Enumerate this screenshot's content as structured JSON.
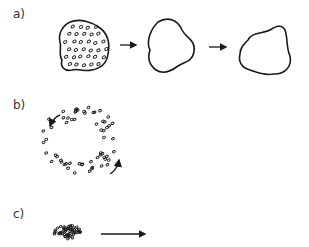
{
  "panels": [
    {
      "id": "a",
      "label": "a)",
      "description": "Cell-filled tissue aggregate loses cells, leaving empty shapes that change form"
    },
    {
      "id": "b",
      "label": "b)",
      "description": "Ring of dots with rotational arrows (circulating motion)"
    },
    {
      "id": "c",
      "label": "c)",
      "description": "Dense cluster of dots moving in direction of arrow"
    }
  ],
  "colors": {
    "stroke": "#1a1a1a",
    "label": "#333333",
    "background": "#ffffff"
  }
}
